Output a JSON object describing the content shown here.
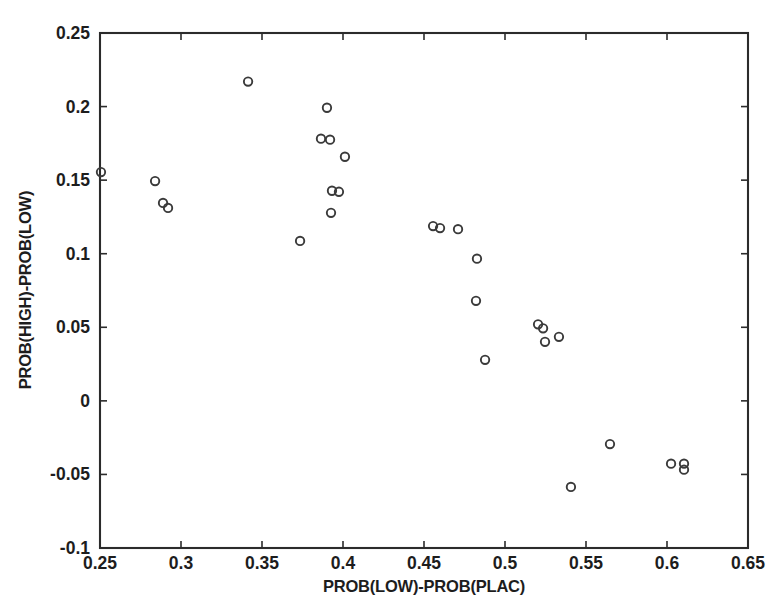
{
  "chart_data": {
    "type": "scatter",
    "title": "",
    "xlabel": "PROB(LOW)-PROB(PLAC)",
    "ylabel": "PROB(HIGH)-PROB(LOW)",
    "xlim": [
      0.25,
      0.65
    ],
    "ylim": [
      -0.1,
      0.25
    ],
    "xticks": [
      0.25,
      0.3,
      0.35,
      0.4,
      0.45,
      0.5,
      0.55,
      0.6,
      0.65
    ],
    "yticks": [
      -0.1,
      -0.05,
      0,
      0.05,
      0.1,
      0.15,
      0.2,
      0.25
    ],
    "xtick_labels": [
      "0.25",
      "0.3",
      "0.35",
      "0.4",
      "0.45",
      "0.5",
      "0.55",
      "0.6",
      "0.65"
    ],
    "ytick_labels": [
      "-0.1",
      "-0.05",
      "0",
      "0.05",
      "0.1",
      "0.15",
      "0.2",
      "0.25"
    ],
    "grid": false,
    "legend": null,
    "marker": "open-circle",
    "marker_color": "#3a3a3a",
    "points": [
      {
        "x": 0.2506,
        "y": 0.1555
      },
      {
        "x": 0.284,
        "y": 0.1494
      },
      {
        "x": 0.2889,
        "y": 0.1345
      },
      {
        "x": 0.292,
        "y": 0.1311
      },
      {
        "x": 0.3414,
        "y": 0.217
      },
      {
        "x": 0.3735,
        "y": 0.1087
      },
      {
        "x": 0.3864,
        "y": 0.1782
      },
      {
        "x": 0.3901,
        "y": 0.1992
      },
      {
        "x": 0.392,
        "y": 0.1775
      },
      {
        "x": 0.3926,
        "y": 0.1278
      },
      {
        "x": 0.3932,
        "y": 0.1428
      },
      {
        "x": 0.3975,
        "y": 0.1421
      },
      {
        "x": 0.4012,
        "y": 0.1659
      },
      {
        "x": 0.4556,
        "y": 0.1188
      },
      {
        "x": 0.4599,
        "y": 0.1174
      },
      {
        "x": 0.471,
        "y": 0.1167
      },
      {
        "x": 0.4827,
        "y": 0.0966
      },
      {
        "x": 0.4821,
        "y": 0.068
      },
      {
        "x": 0.4877,
        "y": 0.0279
      },
      {
        "x": 0.5204,
        "y": 0.052
      },
      {
        "x": 0.5235,
        "y": 0.0493
      },
      {
        "x": 0.5247,
        "y": 0.0401
      },
      {
        "x": 0.5333,
        "y": 0.0435
      },
      {
        "x": 0.5407,
        "y": -0.0585
      },
      {
        "x": 0.5648,
        "y": -0.0294
      },
      {
        "x": 0.6025,
        "y": -0.0427
      },
      {
        "x": 0.6105,
        "y": -0.0427
      },
      {
        "x": 0.6105,
        "y": -0.0468
      }
    ]
  }
}
